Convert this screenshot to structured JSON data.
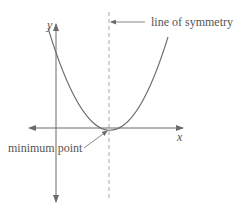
{
  "diagram": {
    "type": "parabola-graph",
    "axes": {
      "x_label": "x",
      "y_label": "y"
    },
    "annotations": {
      "symmetry_label": "line of symmetry",
      "minimum_label": "minimum point"
    },
    "colors": {
      "stroke": "#6b6b6b",
      "text": "#555555",
      "dashed": "#aaaaaa"
    }
  }
}
